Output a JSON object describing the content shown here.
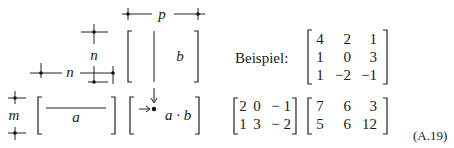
{
  "diagram": {
    "labels": {
      "p": "p",
      "n_vertical": "n",
      "n_horizontal": "n",
      "m": "m",
      "a": "a",
      "b": "b",
      "ab": "a · b"
    }
  },
  "example": {
    "label": "Beispiel:",
    "matrix_b": [
      [
        "4",
        "2",
        "1"
      ],
      [
        "1",
        "0",
        "3"
      ],
      [
        "1",
        "−2",
        "−1"
      ]
    ],
    "matrix_a": [
      [
        "2",
        "0",
        "− 1"
      ],
      [
        "1",
        "3",
        "− 2"
      ]
    ],
    "matrix_ab": [
      [
        "7",
        "6",
        "3"
      ],
      [
        "5",
        "6",
        "12"
      ]
    ]
  },
  "equation_number": "(A.19)"
}
